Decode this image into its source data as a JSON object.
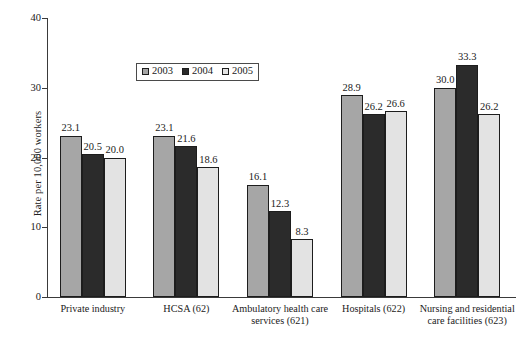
{
  "chart_data": {
    "type": "bar",
    "title": "",
    "subtitle": "",
    "xlabel": "",
    "ylabel": "Rate per 10,000 workers",
    "ylim": [
      0,
      40
    ],
    "ytick_labels": [
      "0",
      "10",
      "20",
      "30",
      "40"
    ],
    "ytick_values": [
      0,
      10,
      20,
      30,
      40
    ],
    "grid": false,
    "legend_position": "upper-center-left",
    "categories": [
      "Private industry",
      "HCSA (62)",
      "Ambulatory health care services (621)",
      "Hospitals (622)",
      "Nursing and residential care facilities (623)"
    ],
    "category_lines": [
      [
        "Private industry"
      ],
      [
        "HCSA (62)"
      ],
      [
        "Ambulatory health care",
        "services (621)"
      ],
      [
        "Hospitals (622)"
      ],
      [
        "Nursing and residential",
        "care facilities (623)"
      ]
    ],
    "series": [
      {
        "name": "2003",
        "color": "#a6a6a6",
        "values": [
          23.1,
          23.1,
          16.1,
          28.9,
          30.0
        ],
        "labels": [
          "23.1",
          "23.1",
          "16.1",
          "28.9",
          "30.0"
        ]
      },
      {
        "name": "2004",
        "color": "#2b2b2b",
        "values": [
          20.5,
          21.6,
          12.3,
          26.2,
          33.3
        ],
        "labels": [
          "20.5",
          "21.6",
          "12.3",
          "26.2",
          "33.3"
        ]
      },
      {
        "name": "2005",
        "color": "#e3e3e3",
        "values": [
          20.0,
          18.6,
          8.3,
          26.6,
          26.2
        ],
        "labels": [
          "20.0",
          "18.6",
          "8.3",
          "26.6",
          "26.2"
        ]
      }
    ]
  },
  "legend": {
    "items": [
      {
        "label": "2003",
        "color": "#a6a6a6"
      },
      {
        "label": "2004",
        "color": "#2b2b2b"
      },
      {
        "label": "2005",
        "color": "#e3e3e3"
      }
    ]
  },
  "axes": {
    "y_title": "Rate per 10,000 workers",
    "y_ticks": [
      "40",
      "30",
      "20",
      "10",
      "0"
    ]
  }
}
